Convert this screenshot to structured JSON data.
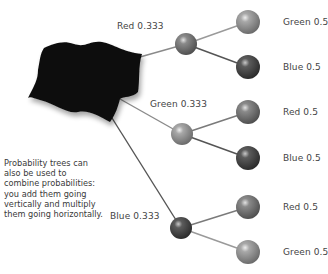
{
  "diagram": {
    "type": "probability-tree",
    "root": {
      "shape": "black-cloth-bag"
    },
    "level1": [
      {
        "label": "Red 0.333",
        "color": "Red",
        "probability": 0.333
      },
      {
        "label": "Green 0.333",
        "color": "Green",
        "probability": 0.333
      },
      {
        "label": "Blue 0.333",
        "color": "Blue",
        "probability": 0.333
      }
    ],
    "level2": [
      {
        "parent": "Red",
        "label": "Green 0.5",
        "color": "Green",
        "probability": 0.5
      },
      {
        "parent": "Red",
        "label": "Blue 0.5",
        "color": "Blue",
        "probability": 0.5
      },
      {
        "parent": "Green",
        "label": "Red 0.5",
        "color": "Red",
        "probability": 0.5
      },
      {
        "parent": "Green",
        "label": "Blue 0.5",
        "color": "Blue",
        "probability": 0.5
      },
      {
        "parent": "Blue",
        "label": "Red 0.5",
        "color": "Red",
        "probability": 0.5
      },
      {
        "parent": "Blue",
        "label": "Green 0.5",
        "color": "Green",
        "probability": 0.5
      }
    ],
    "note": "Probability trees can also be used to combine probabilities: you add them going vertically and multiply them going horizontally."
  }
}
